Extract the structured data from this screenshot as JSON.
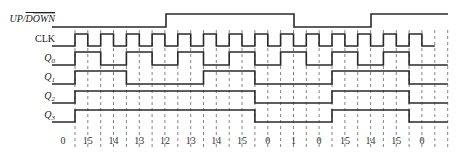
{
  "diagram": {
    "signals": [
      {
        "key": "updown",
        "label": "UP/DOWN",
        "overline_part": "DOWN",
        "italic": true
      },
      {
        "key": "clk",
        "label": "CLK",
        "italic": false
      },
      {
        "key": "q0",
        "label": "Q",
        "sub": "0",
        "italic": true
      },
      {
        "key": "q1",
        "label": "Q",
        "sub": "1",
        "italic": true
      },
      {
        "key": "q2",
        "label": "Q",
        "sub": "2",
        "italic": true
      },
      {
        "key": "q3",
        "label": "Q",
        "sub": "3",
        "italic": true
      }
    ],
    "counts": [
      "0",
      "15",
      "14",
      "13",
      "12",
      "13",
      "14",
      "15",
      "0",
      "1",
      "0",
      "15",
      "14",
      "15",
      "0"
    ],
    "waveforms": {
      "updown_transitions": [
        [
          63,
          0
        ],
        [
          166,
          1
        ],
        [
          294,
          0
        ],
        [
          371,
          1
        ],
        [
          448,
          1
        ]
      ],
      "q0": [
        0,
        1,
        0,
        1,
        0,
        1,
        0,
        1,
        0,
        1,
        0,
        1,
        0,
        1,
        0
      ],
      "q1": [
        0,
        1,
        1,
        0,
        0,
        0,
        1,
        1,
        0,
        0,
        0,
        1,
        1,
        1,
        0
      ],
      "q2": [
        0,
        1,
        1,
        1,
        1,
        1,
        1,
        1,
        0,
        0,
        0,
        1,
        1,
        1,
        0
      ],
      "q3": [
        0,
        1,
        1,
        1,
        1,
        1,
        1,
        1,
        0,
        0,
        0,
        1,
        1,
        1,
        0
      ]
    },
    "colors": {
      "line": "#2a2a2a",
      "grid": "#666666",
      "text": "#222222"
    }
  }
}
